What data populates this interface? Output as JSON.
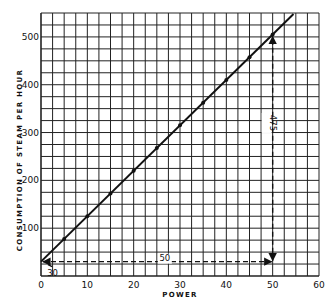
{
  "chart_data": {
    "type": "line",
    "title": "",
    "xlabel": "POWER",
    "ylabel": "CONSUMPTION OF STEAM PER HOUR",
    "xlim": [
      0,
      60
    ],
    "ylim": [
      0,
      550
    ],
    "x_ticks": [
      0,
      10,
      20,
      30,
      40,
      50,
      60
    ],
    "y_ticks": [
      100,
      200,
      300,
      400,
      500
    ],
    "grid": true,
    "grid_step_x": 2.5,
    "grid_step_y": 25,
    "legend": null,
    "series": [
      {
        "name": "Steam consumption",
        "x": [
          0,
          5,
          10,
          15,
          20,
          25,
          30,
          35,
          40,
          45,
          50,
          55
        ],
        "y": [
          30,
          77.5,
          125,
          172.5,
          220,
          267.5,
          315,
          362.5,
          410,
          457.5,
          505,
          552.5
        ],
        "markers_x": [
          5,
          10,
          15,
          20,
          25,
          30,
          35,
          40,
          45,
          50
        ],
        "line_x_range": [
          0,
          54.5
        ]
      }
    ],
    "annotations": [
      {
        "text": "30",
        "type": "intercept",
        "x": 0,
        "y": 30
      },
      {
        "text": "50",
        "type": "horizontal-run",
        "from": [
          0,
          30
        ],
        "to": [
          50,
          30
        ]
      },
      {
        "text": "475",
        "type": "vertical-rise",
        "from": [
          50,
          30
        ],
        "to": [
          50,
          505
        ]
      }
    ],
    "colors": {
      "line": "#111111",
      "grid": "#222222",
      "background": "#ffffff"
    }
  }
}
